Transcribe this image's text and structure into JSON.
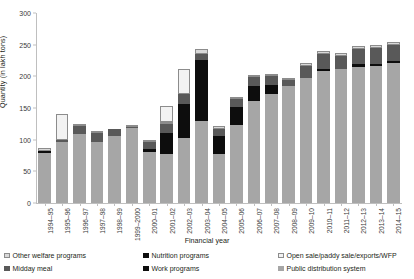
{
  "chart_data": {
    "type": "bar",
    "stacked": true,
    "title": "",
    "xlabel": "Financial year",
    "ylabel": "Quantity (in lakh tons)",
    "ylim": [
      0,
      300
    ],
    "yticks": [
      0,
      50,
      100,
      150,
      200,
      250,
      300
    ],
    "grid": false,
    "legend_position": "bottom",
    "categories": [
      "1994–95",
      "1995–96",
      "1996–97",
      "1997–98",
      "1998–99",
      "1999–2000",
      "2000–01",
      "2001–02",
      "2002–03",
      "2003–04",
      "2004–05",
      "2005–06",
      "2006–07",
      "2007–08",
      "2008–09",
      "2009–10",
      "2010–11",
      "2011–12",
      "2012–13",
      "2013–14",
      "2014–15"
    ],
    "series": [
      {
        "name": "Public distribution system",
        "color": "#a6a6a6",
        "outlined": false,
        "values": [
          79,
          97,
          109,
          96,
          106,
          118,
          80,
          78,
          102,
          129,
          77,
          123,
          161,
          172,
          184,
          198,
          208,
          211,
          215,
          216,
          221
        ]
      },
      {
        "name": "Work programs",
        "color": "#0d0d0d",
        "outlined": false,
        "values": [
          3,
          0,
          0,
          0,
          0,
          0,
          5,
          33,
          55,
          97,
          29,
          29,
          23,
          14,
          0,
          0,
          0,
          0,
          0,
          0,
          0
        ]
      },
      {
        "name": "Nutrition programs",
        "color": "#0d0d0d",
        "outlined": false,
        "values": [
          0,
          0,
          0,
          0,
          0,
          0,
          0,
          0,
          0,
          0,
          0,
          0,
          0,
          0,
          0,
          0,
          4,
          0,
          4,
          3,
          3
        ]
      },
      {
        "name": "Midday meal",
        "color": "#595959",
        "outlined": false,
        "values": [
          0,
          2,
          12,
          15,
          11,
          2,
          11,
          14,
          15,
          9,
          11,
          12,
          15,
          15,
          11,
          18,
          23,
          21,
          24,
          25,
          26
        ]
      },
      {
        "name": "Other welfare programs",
        "color": "#d9d9d9",
        "outlined": true,
        "values": [
          5,
          0,
          2,
          1,
          0,
          2,
          4,
          1,
          0,
          9,
          4,
          4,
          3,
          3,
          3,
          5,
          5,
          5,
          5,
          5,
          5
        ]
      },
      {
        "name": "Open sale/paddy sale/exports/WFP",
        "color": "#f2f2f2",
        "outlined": true,
        "values": [
          0,
          41,
          0,
          0,
          0,
          0,
          0,
          25,
          40,
          0,
          0,
          0,
          0,
          0,
          0,
          0,
          0,
          0,
          0,
          0,
          0
        ]
      }
    ]
  },
  "legend": {
    "columns": [
      {
        "left_px": 4,
        "items": [
          {
            "label": "Other welfare programs",
            "color": "#d9d9d9",
            "outlined": true,
            "icon": "legend-swatch-other-welfare"
          },
          {
            "label": "Midday meal",
            "color": "#595959",
            "outlined": false,
            "icon": "legend-swatch-midday-meal"
          }
        ]
      },
      {
        "left_px": 143,
        "items": [
          {
            "label": "Nutrition programs",
            "color": "#0d0d0d",
            "outlined": false,
            "icon": "legend-swatch-nutrition"
          },
          {
            "label": "Work programs",
            "color": "#0d0d0d",
            "outlined": false,
            "icon": "legend-swatch-work"
          }
        ]
      },
      {
        "left_px": 278,
        "items": [
          {
            "label": "Open sale/paddy sale/exports/WFP",
            "color": "#f2f2f2",
            "outlined": true,
            "icon": "legend-swatch-open-sale"
          },
          {
            "label": "Public distribution system",
            "color": "#a6a6a6",
            "outlined": false,
            "icon": "legend-swatch-pds"
          }
        ]
      }
    ]
  }
}
